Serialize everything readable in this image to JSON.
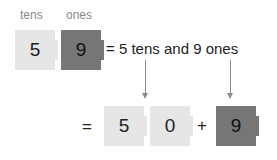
{
  "labels": {
    "tens": "tens",
    "ones": "ones"
  },
  "top_blocks": [
    {
      "value": "5",
      "style": "light",
      "place": "tens"
    },
    {
      "value": "9",
      "style": "dark",
      "place": "ones"
    }
  ],
  "equation_text": "= 5 tens and 9 ones",
  "bottom": {
    "equals": "=",
    "blocks": [
      {
        "value": "5",
        "style": "light"
      },
      {
        "value": "0",
        "style": "light"
      },
      {
        "value": "9",
        "style": "dark"
      }
    ],
    "plus": "+"
  },
  "colors": {
    "light_block": "#e6e6e6",
    "dark_block": "#767676",
    "arrow": "#8a8a8a",
    "label": "#8a8a8a"
  }
}
